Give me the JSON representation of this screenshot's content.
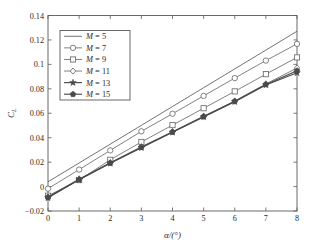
{
  "chart_data": {
    "type": "line",
    "title": "",
    "xlabel": "α/(°)",
    "ylabel": "C_L",
    "ylabel_base": "C",
    "ylabel_sub": "L",
    "xlim": [
      0,
      8
    ],
    "ylim": [
      -0.02,
      0.14
    ],
    "xticks": [
      0,
      1,
      2,
      3,
      4,
      5,
      6,
      7,
      8
    ],
    "yticks": [
      -0.02,
      0,
      0.02,
      0.04,
      0.06,
      0.08,
      0.1,
      0.12,
      0.14
    ],
    "xtick_labels": [
      "0",
      "1",
      "2",
      "3",
      "4",
      "5",
      "6",
      "7",
      "8"
    ],
    "ytick_labels": [
      "−0.02",
      "0",
      "0.02",
      "0.04",
      "0.06",
      "0.08",
      "0.1",
      "0.12",
      "0.14"
    ],
    "grid": false,
    "legend_position": "upper left",
    "x": [
      0,
      1,
      2,
      3,
      4,
      5,
      6,
      7,
      8
    ],
    "series": [
      {
        "name": "M = 5",
        "label_var": "M",
        "label_value": "5",
        "marker": "none",
        "color": "#5a5a5a",
        "values": [
          0.0039,
          0.0193,
          0.0347,
          0.0501,
          0.0655,
          0.0809,
          0.0963,
          0.1117,
          0.1271
        ]
      },
      {
        "name": "M = 7",
        "label_var": "M",
        "label_value": "7",
        "marker": "circle",
        "color": "#6b6b6b",
        "values": [
          -0.0017,
          0.0139,
          0.0296,
          0.0452,
          0.0596,
          0.0742,
          0.0888,
          0.1031,
          0.1168
        ]
      },
      {
        "name": "M = 9",
        "label_var": "M",
        "label_value": "9",
        "marker": "square",
        "color": "#6b6b6b",
        "values": [
          -0.0075,
          0.0053,
          0.0219,
          0.0365,
          0.0503,
          0.0641,
          0.0779,
          0.092,
          0.1057
        ]
      },
      {
        "name": "M = 11",
        "label_var": "M",
        "label_value": "11",
        "marker": "diamond",
        "color": "#6b6b6b",
        "values": [
          -0.0085,
          0.0063,
          0.0196,
          0.0326,
          0.0449,
          0.0576,
          0.07,
          0.084,
          0.097
        ]
      },
      {
        "name": "M = 13",
        "label_var": "M",
        "label_value": "13",
        "marker": "star",
        "color": "#4a4a4a",
        "values": [
          -0.0092,
          0.0055,
          0.019,
          0.0318,
          0.0444,
          0.057,
          0.0695,
          0.0832,
          0.0931
        ]
      },
      {
        "name": "M = 15",
        "label_var": "M",
        "label_value": "15",
        "marker": "pentagon",
        "color": "#4a4a4a",
        "values": [
          -0.0088,
          0.0058,
          0.0193,
          0.0322,
          0.0447,
          0.0573,
          0.0698,
          0.0836,
          0.0948
        ]
      }
    ]
  },
  "figure": {
    "axis_color": "#5a5a5a",
    "text_color": "#2b2b2b",
    "background": "#ffffff"
  }
}
